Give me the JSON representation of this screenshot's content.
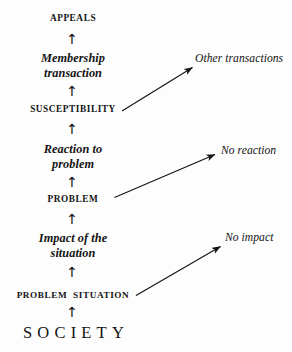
{
  "diagram": {
    "background_color": "#fdfdfd",
    "ink_color": "#141414",
    "chain": [
      {
        "id": "appeals",
        "label": "APPEALS",
        "style": "caps"
      },
      {
        "id": "membership",
        "label": "Membership\ntransaction",
        "style": "phrase"
      },
      {
        "id": "susceptibility",
        "label": "SUSCEPTIBILITY",
        "style": "caps"
      },
      {
        "id": "reaction",
        "label": "Reaction to\nproblem",
        "style": "phrase"
      },
      {
        "id": "problem",
        "label": "PROBLEM",
        "style": "caps"
      },
      {
        "id": "impact",
        "label": "Impact of the\nsituation",
        "style": "phrase"
      },
      {
        "id": "problem_situation",
        "label": "PROBLEM  SITUATION",
        "style": "caps"
      },
      {
        "id": "society",
        "label": "SOCIETY",
        "style": "society"
      }
    ],
    "branches": [
      {
        "id": "other_transactions",
        "label": "Other transactions",
        "from": "susceptibility"
      },
      {
        "id": "no_reaction",
        "label": "No reaction",
        "from": "problem"
      },
      {
        "id": "no_impact",
        "label": "No impact",
        "from": "problem_situation"
      }
    ],
    "up_arrow_glyph": "↑",
    "up_arrow_count": 7
  }
}
